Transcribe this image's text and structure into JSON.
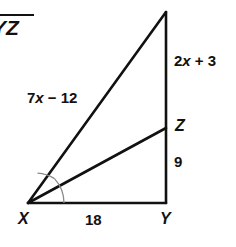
{
  "figure": {
    "kind": "geometry-diagram",
    "stroke_color": "#111111",
    "background_color": "#ffffff",
    "arc_color": "#8a8a8a",
    "segment_notation": {
      "text": "YZ",
      "overbar": true,
      "cropped_at_left": true
    },
    "vertices": [
      {
        "name": "W",
        "label": "W",
        "x": 166,
        "y": 12,
        "cropped_at_top": true
      },
      {
        "name": "X",
        "label": "X",
        "x": 28,
        "y": 203
      },
      {
        "name": "Y",
        "label": "Y",
        "x": 166,
        "y": 203
      },
      {
        "name": "Z",
        "label": "Z",
        "x": 166,
        "y": 128
      }
    ],
    "edges": [
      {
        "name": "XW",
        "from": "X",
        "to": "W",
        "label": "7x − 12"
      },
      {
        "name": "WY",
        "from": "W",
        "to": "Y",
        "label": null
      },
      {
        "name": "XY",
        "from": "X",
        "to": "Y",
        "label": "18"
      },
      {
        "name": "XZ",
        "from": "X",
        "to": "Z",
        "label": null
      },
      {
        "name": "WZ",
        "from": "W",
        "to": "Z",
        "label": "2x + 3"
      },
      {
        "name": "ZY",
        "from": "Z",
        "to": "Y",
        "label": "9"
      }
    ],
    "labels": {
      "side_wz": {
        "prefix": "2",
        "variable": "x",
        "suffix": " + 3",
        "full": "2x + 3"
      },
      "side_xw": {
        "prefix": "7",
        "variable": "x",
        "suffix": " − 12",
        "full": "7x − 12"
      },
      "side_zy": "9",
      "side_xy": "18",
      "vertex_w": "W",
      "vertex_x": "X",
      "vertex_y": "Y",
      "vertex_z": "Z"
    },
    "angle_marks": {
      "at_vertex": "X",
      "count": 2,
      "meaning": "congruent angles — XZ bisects angle WXY"
    }
  }
}
